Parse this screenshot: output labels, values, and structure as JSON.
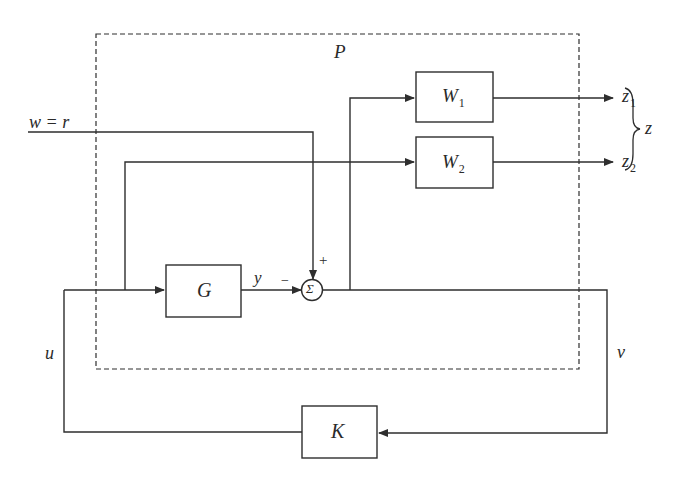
{
  "diagram": {
    "type": "block-diagram",
    "colors": {
      "line": "#2e2e2e",
      "background": "#ffffff"
    },
    "generalized_plant": {
      "label": "P",
      "style": "dashed"
    },
    "blocks": {
      "W1": {
        "name": "W",
        "sub": "1"
      },
      "W2": {
        "name": "W",
        "sub": "2"
      },
      "G": {
        "name": "G"
      },
      "K": {
        "name": "K"
      }
    },
    "summing_junction": {
      "symbol": "Σ",
      "plus_sign": "+",
      "minus_sign": "−"
    },
    "signals": {
      "input": "w = r",
      "plant_output": "y",
      "control": "u",
      "measurement": "v",
      "z1": {
        "name": "z",
        "sub": "1"
      },
      "z2": {
        "name": "z",
        "sub": "2"
      },
      "z": "z"
    },
    "edges": [
      {
        "from": "w",
        "to": "sum",
        "sign": "+"
      },
      {
        "from": "G",
        "to": "sum",
        "sign": "-",
        "label": "y"
      },
      {
        "from": "sum",
        "to": "W1"
      },
      {
        "from": "sum",
        "to": "v"
      },
      {
        "from": "u",
        "to": "G"
      },
      {
        "from": "u",
        "to": "W2"
      },
      {
        "from": "W1",
        "to": "z1"
      },
      {
        "from": "W2",
        "to": "z2"
      },
      {
        "from": "v",
        "to": "K"
      },
      {
        "from": "K",
        "to": "u"
      }
    ]
  }
}
